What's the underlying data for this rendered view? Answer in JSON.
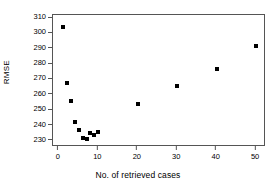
{
  "chart_data": {
    "type": "scatter",
    "title": "",
    "xlabel": "No. of retrieved cases",
    "ylabel": "RMSE",
    "xlim": [
      -1.5,
      52.5
    ],
    "ylim": [
      226,
      312
    ],
    "xticks": [
      0,
      10,
      20,
      30,
      40,
      50
    ],
    "yticks": [
      230,
      240,
      250,
      260,
      270,
      280,
      290,
      300,
      310
    ],
    "grid": false,
    "legend": null,
    "marker": "filled-square",
    "marker_color": "#000000",
    "x": [
      1,
      2,
      3,
      4,
      5,
      6,
      7,
      8,
      9,
      10,
      20,
      30,
      40,
      50
    ],
    "y": [
      304,
      268,
      256,
      242,
      237,
      232,
      231,
      235,
      234,
      236,
      254,
      266,
      277,
      292
    ],
    "points": [
      {
        "x": 1,
        "y": 304
      },
      {
        "x": 2,
        "y": 268
      },
      {
        "x": 3,
        "y": 256
      },
      {
        "x": 4,
        "y": 242
      },
      {
        "x": 5,
        "y": 237
      },
      {
        "x": 6,
        "y": 232
      },
      {
        "x": 7,
        "y": 231
      },
      {
        "x": 8,
        "y": 235
      },
      {
        "x": 9,
        "y": 234
      },
      {
        "x": 10,
        "y": 236
      },
      {
        "x": 20,
        "y": 254
      },
      {
        "x": 30,
        "y": 266
      },
      {
        "x": 40,
        "y": 277
      },
      {
        "x": 50,
        "y": 292
      }
    ]
  }
}
